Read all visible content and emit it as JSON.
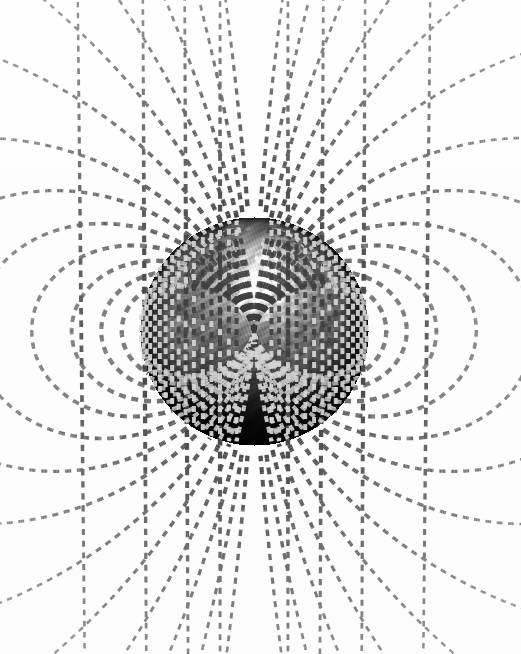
{
  "figure": {
    "title": "Earth's magnetic dipole field",
    "background_color": "#ffffff",
    "width": 521,
    "height": 654
  },
  "globe": {
    "name": "earth-globe",
    "center_x": 254,
    "center_y": 331,
    "radius": 114,
    "tilt_degrees": 0,
    "shading": "lit from upper-center, terminator toward lower-left and right limb",
    "colors": {
      "ocean_light": "#b9b9b9",
      "ocean_mid": "#6e6e6e",
      "ocean_dark": "#1a1a1a",
      "land_light": "#8d8d8d",
      "land_dark": "#3a3a3a",
      "highlight": "#e8e8e8",
      "limb_shadow": "#000000"
    },
    "visible_features": [
      "north-polar-bright-cap",
      "north-america",
      "greenland",
      "europe",
      "africa",
      "south-america-limb",
      "dark-southern-hemisphere"
    ]
  },
  "field": {
    "name": "magnetic-field-lines",
    "style": "dashed",
    "line_color_near": "#4a4a4a",
    "line_color_far": "#c9c9c9",
    "dash_length_near": 7,
    "dash_gap_near": 6,
    "dash_length_far": 4,
    "dash_gap_far": 5,
    "width_near": 4.6,
    "width_far": 1.1,
    "line_count": 16,
    "north_pole_angle_deg": 90,
    "south_pole_angle_deg": 270,
    "description": "Dipole field lines emerging from the north magnetic pole, looping outward and re-entering at the south magnetic pole.",
    "shells": [
      {
        "id": "L1",
        "L": 1.16,
        "footprint_colatitude_deg": 22.0,
        "closed": true
      },
      {
        "id": "L2",
        "L": 1.34,
        "footprint_colatitude_deg": 30.4,
        "closed": true
      },
      {
        "id": "L3",
        "L": 1.6,
        "footprint_colatitude_deg": 37.8,
        "closed": true
      },
      {
        "id": "L4",
        "L": 1.95,
        "footprint_colatitude_deg": 45.6,
        "closed": true
      },
      {
        "id": "L5",
        "L": 2.45,
        "footprint_colatitude_deg": 50.4,
        "closed": true
      },
      {
        "id": "L6",
        "L": 3.2,
        "footprint_colatitude_deg": 56.0,
        "closed": true
      },
      {
        "id": "L7",
        "L": 4.4,
        "footprint_colatitude_deg": 61.5,
        "closed": true
      },
      {
        "id": "L8",
        "L": 7.0,
        "footprint_colatitude_deg": 67.8,
        "closed": false
      },
      {
        "id": "L9",
        "L": 12.0,
        "footprint_colatitude_deg": 73.0,
        "closed": false
      },
      {
        "id": "L10",
        "L": 22.0,
        "footprint_colatitude_deg": 77.7,
        "closed": false
      },
      {
        "id": "L11",
        "L": 45.0,
        "footprint_colatitude_deg": 81.5,
        "closed": false
      },
      {
        "id": "L12",
        "L": 110.0,
        "footprint_colatitude_deg": 84.5,
        "closed": false
      },
      {
        "id": "L13",
        "L": 400.0,
        "footprint_colatitude_deg": 87.1,
        "closed": false
      }
    ]
  },
  "chart_data": {
    "type": "line",
    "title": "Earth's magnetic dipole field",
    "xlabel": "",
    "ylabel": "",
    "grid": false,
    "legend": "none",
    "series": [
      {
        "name": "L = 1.16",
        "L": 1.16
      },
      {
        "name": "L = 1.34",
        "L": 1.34
      },
      {
        "name": "L = 1.60",
        "L": 1.6
      },
      {
        "name": "L = 1.95",
        "L": 1.95
      },
      {
        "name": "L = 2.45",
        "L": 2.45
      },
      {
        "name": "L = 3.20",
        "L": 3.2
      },
      {
        "name": "L = 4.40",
        "L": 4.4
      },
      {
        "name": "L = 7.00",
        "L": 7.0
      },
      {
        "name": "L = 12.0",
        "L": 12.0
      },
      {
        "name": "L = 22.0",
        "L": 22.0
      },
      {
        "name": "L = 45.0",
        "L": 45.0
      },
      {
        "name": "L = 110",
        "L": 110.0
      },
      {
        "name": "L = 400",
        "L": 400.0
      }
    ]
  }
}
